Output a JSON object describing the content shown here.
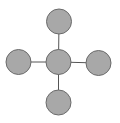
{
  "diagram": {
    "type": "star-graph",
    "colors": {
      "node_fill": "#a8a8a8",
      "node_stroke": "#6a6a6a",
      "edge_stroke": "#555555",
      "background": "#ffffff"
    },
    "node_radius": 12.5,
    "nodes": [
      {
        "id": "center",
        "cx": 58.5,
        "cy": 62,
        "label": ""
      },
      {
        "id": "top",
        "cx": 59,
        "cy": 21.5,
        "label": ""
      },
      {
        "id": "left",
        "cx": 18.5,
        "cy": 62,
        "label": ""
      },
      {
        "id": "right",
        "cx": 98.5,
        "cy": 63,
        "label": ""
      },
      {
        "id": "bottom",
        "cx": 58.5,
        "cy": 102.5,
        "label": ""
      }
    ],
    "edges": [
      {
        "from": "center",
        "to": "top"
      },
      {
        "from": "center",
        "to": "left"
      },
      {
        "from": "center",
        "to": "right"
      },
      {
        "from": "center",
        "to": "bottom"
      }
    ]
  }
}
